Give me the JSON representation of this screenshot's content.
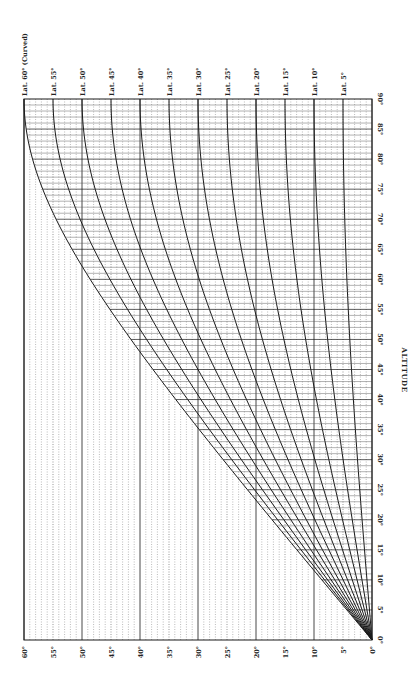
{
  "chart_data": {
    "type": "line",
    "orientation": "rotated 90 degrees clockwise (read with page turned)",
    "title": "",
    "xlabel": "ALTITUDE",
    "ylabel": "",
    "x_axis": {
      "label": "ALTITUDE",
      "range": [
        0,
        90
      ],
      "ticks": [
        "0°",
        "5°",
        "10°",
        "15°",
        "20°",
        "25°",
        "30°",
        "35°",
        "40°",
        "45°",
        "50°",
        "55°",
        "60°",
        "65°",
        "70°",
        "75°",
        "80°",
        "85°",
        "90°"
      ]
    },
    "y_axis": {
      "range": [
        0,
        60
      ],
      "ticks": [
        "0°",
        "5°",
        "10°",
        "15°",
        "20°",
        "25°",
        "30°",
        "35°",
        "40°",
        "45°",
        "50°",
        "55°",
        "60°"
      ]
    },
    "grid": true,
    "formula_hint": "y = asin(sin(lat) * sin(altitude))",
    "series": [
      {
        "name": "Lat. 60° (Curved)",
        "lat": 60
      },
      {
        "name": "Lat. 55°",
        "lat": 55
      },
      {
        "name": "Lat. 50°",
        "lat": 50
      },
      {
        "name": "Lat. 45°",
        "lat": 45
      },
      {
        "name": "Lat. 40°",
        "lat": 40
      },
      {
        "name": "Lat. 35°",
        "lat": 35
      },
      {
        "name": "Lat. 30°",
        "lat": 30
      },
      {
        "name": "Lat. 25°",
        "lat": 25
      },
      {
        "name": "Lat. 20°",
        "lat": 20
      },
      {
        "name": "Lat. 15°",
        "lat": 15
      },
      {
        "name": "Lat. 10°",
        "lat": 10
      },
      {
        "name": "Lat. 5°",
        "lat": 5
      }
    ],
    "sample_points_altitude": [
      0,
      15,
      30,
      45,
      60,
      75,
      90
    ],
    "sample_values": {
      "Lat. 60° (Curved)": [
        0,
        13.0,
        25.7,
        37.8,
        48.6,
        56.8,
        60
      ],
      "Lat. 55°": [
        0,
        12.2,
        24.2,
        35.4,
        45.2,
        52.3,
        55
      ],
      "Lat. 50°": [
        0,
        11.4,
        22.5,
        32.8,
        41.6,
        47.7,
        50
      ],
      "Lat. 45°": [
        0,
        10.5,
        20.7,
        30.0,
        37.8,
        43.1,
        45
      ],
      "Lat. 40°": [
        0,
        9.6,
        18.7,
        27.0,
        33.8,
        38.4,
        40
      ],
      "Lat. 35°": [
        0,
        8.5,
        16.7,
        23.9,
        29.8,
        33.7,
        35
      ],
      "Lat. 30°": [
        0,
        7.4,
        14.5,
        20.7,
        25.7,
        28.9,
        30
      ],
      "Lat. 25°": [
        0,
        6.3,
        12.2,
        17.4,
        21.5,
        24.1,
        25
      ],
      "Lat. 20°": [
        0,
        5.1,
        9.8,
        14.0,
        17.2,
        19.3,
        20
      ],
      "Lat. 15°": [
        0,
        3.8,
        7.4,
        10.5,
        13.0,
        14.5,
        15
      ],
      "Lat. 10°": [
        0,
        2.6,
        5.0,
        7.1,
        8.7,
        9.7,
        10
      ],
      "Lat. 5°": [
        0,
        1.3,
        2.5,
        3.5,
        4.3,
        4.8,
        5
      ]
    }
  },
  "colors": {
    "ink": "#1a1a1a",
    "grid": "#555555",
    "background": "#ffffff"
  }
}
